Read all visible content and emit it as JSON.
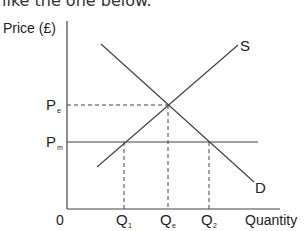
{
  "intro_text": "like the one below.",
  "diagram": {
    "y_axis_label": "Price (£)",
    "x_axis_label": "Quantity",
    "origin_label": "0",
    "supply_label": "S",
    "demand_label": "D",
    "price_labels": [
      {
        "main": "P",
        "sub": "e"
      },
      {
        "main": "P",
        "sub": "m"
      }
    ],
    "quantity_labels": [
      {
        "main": "Q",
        "sub": "1"
      },
      {
        "main": "Q",
        "sub": "e"
      },
      {
        "main": "Q",
        "sub": "2"
      }
    ]
  }
}
